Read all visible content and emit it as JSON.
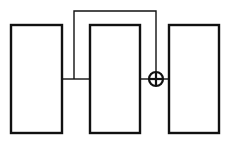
{
  "diagram": {
    "type": "block-diagram",
    "blocks": [
      {
        "id": "block-1",
        "label": "",
        "x": 11,
        "y": 25,
        "width": 51,
        "height": 108
      },
      {
        "id": "block-2",
        "label": "",
        "x": 90,
        "y": 25,
        "width": 50,
        "height": 108
      },
      {
        "id": "block-3",
        "label": "",
        "x": 169,
        "y": 25,
        "width": 50,
        "height": 108
      }
    ],
    "summing_junction": {
      "id": "sum",
      "symbol": "plus-circle",
      "cx": 156,
      "cy": 79,
      "r": 7
    },
    "connections": [
      {
        "from": "block-1",
        "to": "block-2",
        "kind": "direct"
      },
      {
        "from": "block-1",
        "to": "sum",
        "kind": "skip",
        "route": "up-over-down"
      },
      {
        "from": "block-2",
        "to": "sum",
        "kind": "direct"
      },
      {
        "from": "sum",
        "to": "block-3",
        "kind": "direct"
      }
    ],
    "colors": {
      "stroke": "#111111",
      "background": "#ffffff"
    }
  }
}
